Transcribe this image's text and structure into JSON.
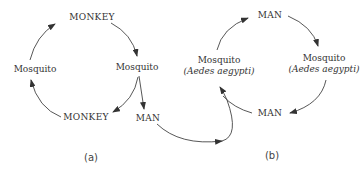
{
  "diagram": {
    "panel_a": {
      "caption": "(a)",
      "nodes": {
        "top": "MONKEY",
        "left": "Mosquito",
        "right": "Mosquito",
        "bottom": "MONKEY",
        "branch": "MAN"
      }
    },
    "panel_b": {
      "caption": "(b)",
      "nodes": {
        "top": "MAN",
        "left_name": "Mosquito",
        "left_species": "(Aedes aegypti)",
        "right_name": "Mosquito",
        "right_species": "(Aedes aegypti)",
        "bottom": "MAN"
      }
    },
    "colors": {
      "line": "#333333",
      "text": "#333333",
      "background": "#ffffff"
    }
  }
}
